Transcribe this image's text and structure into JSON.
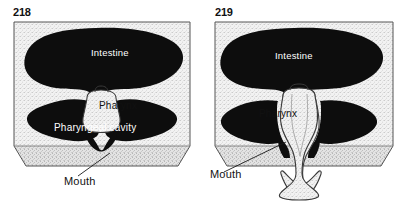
{
  "figure": {
    "panels": [
      {
        "number": "218",
        "caption_state": "retracted",
        "labels": {
          "intestine": "Intestine",
          "pharynx": "Pharynx",
          "pharyngeal_cavity": "Pharyngeal  cavity",
          "mouth": "Mouth"
        }
      },
      {
        "number": "219",
        "caption_state": "protruded",
        "labels": {
          "intestine": "Intestine",
          "pharynx": "Pharynx",
          "mouth": "Mouth"
        }
      }
    ],
    "colors": {
      "organ_fill": "#0d0d0d",
      "tissue_fill": "#efefef",
      "block_side": "#dcdcdc",
      "outline": "#2b2b2b",
      "label_light": "#ffffff",
      "label_dark": "#111111",
      "background": "#ffffff"
    }
  }
}
